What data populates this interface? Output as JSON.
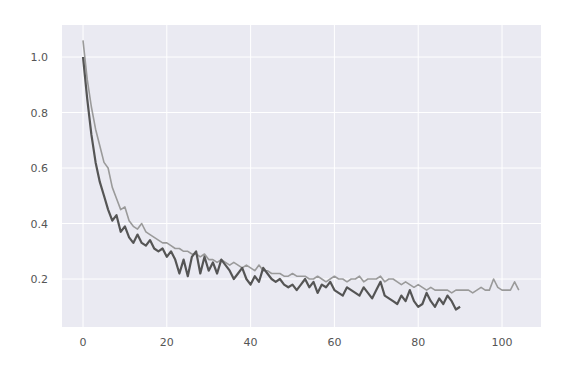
{
  "chart_data": {
    "type": "line",
    "title": "",
    "xlabel": "",
    "ylabel": "",
    "xlim": [
      -5,
      109
    ],
    "ylim": [
      0.05,
      1.1
    ],
    "grid": true,
    "legend": null,
    "x_ticks": [
      0,
      20,
      40,
      60,
      80,
      100
    ],
    "x_tick_labels": [
      "0",
      "20",
      "40",
      "60",
      "80",
      "100"
    ],
    "y_ticks": [
      0.2,
      0.4,
      0.6,
      0.8,
      1.0
    ],
    "y_tick_labels": [
      "0.2",
      "0.4",
      "0.6",
      "0.8",
      "1.0"
    ],
    "colors": {
      "background": "#eaeaf2",
      "grid": "#ffffff",
      "series_light": "#9a9a9a",
      "series_dark": "#555555",
      "tick_text": "#555555"
    },
    "series": [
      {
        "name": "series_light",
        "x_start": 0,
        "values": [
          1.06,
          0.92,
          0.82,
          0.74,
          0.68,
          0.62,
          0.6,
          0.53,
          0.49,
          0.45,
          0.46,
          0.41,
          0.39,
          0.38,
          0.4,
          0.37,
          0.36,
          0.35,
          0.34,
          0.33,
          0.33,
          0.32,
          0.31,
          0.31,
          0.3,
          0.3,
          0.29,
          0.29,
          0.28,
          0.29,
          0.27,
          0.27,
          0.26,
          0.27,
          0.26,
          0.25,
          0.26,
          0.25,
          0.24,
          0.25,
          0.24,
          0.23,
          0.25,
          0.23,
          0.23,
          0.22,
          0.22,
          0.22,
          0.21,
          0.21,
          0.22,
          0.21,
          0.21,
          0.21,
          0.2,
          0.2,
          0.21,
          0.2,
          0.19,
          0.2,
          0.21,
          0.2,
          0.2,
          0.19,
          0.2,
          0.2,
          0.21,
          0.19,
          0.2,
          0.2,
          0.2,
          0.21,
          0.19,
          0.2,
          0.2,
          0.19,
          0.18,
          0.19,
          0.18,
          0.17,
          0.18,
          0.17,
          0.16,
          0.17,
          0.16,
          0.16,
          0.16,
          0.16,
          0.15,
          0.16,
          0.16,
          0.16,
          0.16,
          0.15,
          0.16,
          0.17,
          0.16,
          0.16,
          0.2,
          0.17,
          0.16,
          0.16,
          0.16,
          0.19,
          0.16
        ]
      },
      {
        "name": "series_dark",
        "x_start": 0,
        "values": [
          1.0,
          0.85,
          0.72,
          0.62,
          0.55,
          0.5,
          0.45,
          0.41,
          0.43,
          0.37,
          0.39,
          0.35,
          0.33,
          0.36,
          0.33,
          0.32,
          0.34,
          0.31,
          0.3,
          0.31,
          0.28,
          0.3,
          0.27,
          0.22,
          0.27,
          0.21,
          0.28,
          0.3,
          0.22,
          0.28,
          0.23,
          0.26,
          0.22,
          0.27,
          0.25,
          0.23,
          0.2,
          0.22,
          0.24,
          0.2,
          0.18,
          0.21,
          0.19,
          0.24,
          0.22,
          0.2,
          0.19,
          0.2,
          0.18,
          0.17,
          0.18,
          0.16,
          0.18,
          0.2,
          0.17,
          0.19,
          0.15,
          0.18,
          0.17,
          0.19,
          0.16,
          0.15,
          0.14,
          0.17,
          0.16,
          0.15,
          0.14,
          0.17,
          0.15,
          0.13,
          0.16,
          0.19,
          0.14,
          0.13,
          0.12,
          0.11,
          0.14,
          0.12,
          0.16,
          0.12,
          0.1,
          0.11,
          0.15,
          0.12,
          0.1,
          0.13,
          0.11,
          0.14,
          0.12,
          0.09,
          0.1
        ]
      }
    ]
  }
}
